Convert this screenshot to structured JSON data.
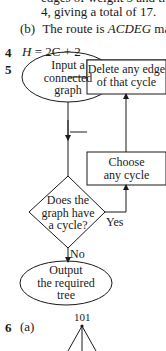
{
  "q3_continuation": {
    "line_partial": "edges of weight 5 and the",
    "line2": "4, giving a total of 17.",
    "part_b_label": "(b)",
    "part_b_text_pre": "The route is ",
    "part_b_route": "ACDEG",
    "part_b_text_post": " makin"
  },
  "q4": {
    "number": "4",
    "equation_lhs": "H",
    "equation_rhs": "= 2C + 2"
  },
  "q5": {
    "number": "5",
    "flowchart": {
      "start": "Input a connected graph",
      "start_lines": [
        "Input a",
        "connected",
        "graph"
      ],
      "decision_lines": [
        "Does the",
        "graph have",
        "a cycle?"
      ],
      "choose_lines": [
        "Choose",
        "any cycle"
      ],
      "delete_lines": [
        "Delete any edge",
        "of that cycle"
      ],
      "yes_label": "Yes",
      "no_label": "No",
      "end_lines": [
        "Output",
        "the required",
        "tree"
      ]
    }
  },
  "q6": {
    "number": "6",
    "part_a_label": "(a)",
    "tree_root": "101"
  }
}
